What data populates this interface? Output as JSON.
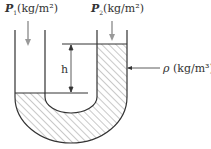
{
  "diagram": {
    "labels": {
      "p1_symbol": "P",
      "p1_sub": "1",
      "p1_unit": "(kg/m²)",
      "p2_symbol": "P",
      "p2_sub": "2",
      "p2_unit": "(kg/m²)",
      "height": "h",
      "density_symbol": "ρ",
      "density_unit": "(kg/m³)"
    },
    "colors": {
      "line": "#333333",
      "arrow": "#888888",
      "hatch": "#666666"
    }
  }
}
